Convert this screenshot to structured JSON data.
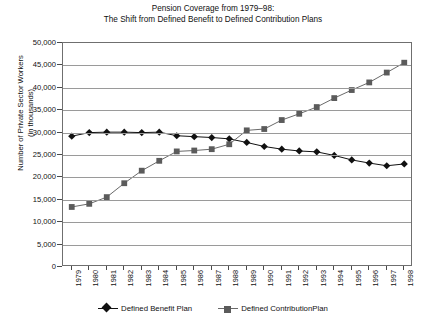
{
  "chart_data": {
    "type": "line",
    "title_lines": [
      "Pension Coverage from 1979–98:",
      "The Shift from Defined Benefit to Defined Contribution Plans"
    ],
    "ylabel_lines": [
      "Number of Private Sector Workers",
      "(in thousands)"
    ],
    "xlabel": "",
    "categories": [
      "1979",
      "1980",
      "1981",
      "1982",
      "1983",
      "1984",
      "1985",
      "1986",
      "1987",
      "1988",
      "1989",
      "1990",
      "1991",
      "1992",
      "1993",
      "1994",
      "1995",
      "1996",
      "1997",
      "1998"
    ],
    "ylim": [
      0,
      50000
    ],
    "ytick_values": [
      "0",
      "5,000",
      "10,000",
      "15,000",
      "20,000",
      "25,000",
      "30,000",
      "35,000",
      "40,000",
      "45,000",
      "50,000"
    ],
    "ytick_numbers": [
      0,
      5000,
      10000,
      15000,
      20000,
      25000,
      30000,
      35000,
      40000,
      45000,
      50000
    ],
    "ytick_step": 5000,
    "grid": true,
    "legend_position": "bottom",
    "series": [
      {
        "name": "Defined Benefit Plan",
        "marker": "diamond",
        "color": "#111111",
        "line_color": "#111111",
        "values": [
          29200,
          30000,
          30100,
          30100,
          30000,
          30100,
          29300,
          29100,
          28900,
          28600,
          27800,
          26900,
          26300,
          25900,
          25700,
          24900,
          23900,
          23200,
          22600,
          23000
        ]
      },
      {
        "name": "Defined ContributionPlan",
        "marker": "square",
        "color": "#5b5b5b",
        "line_color": "#6a6a6a",
        "values": [
          13400,
          14100,
          15600,
          18700,
          21500,
          23700,
          25800,
          26000,
          26300,
          27400,
          30500,
          30800,
          32800,
          34200,
          35700,
          37700,
          39500,
          41200,
          43400,
          45600
        ]
      }
    ]
  },
  "legend": {
    "items": [
      {
        "label": "Defined Benefit Plan"
      },
      {
        "label": "Defined ContributionPlan"
      }
    ]
  }
}
